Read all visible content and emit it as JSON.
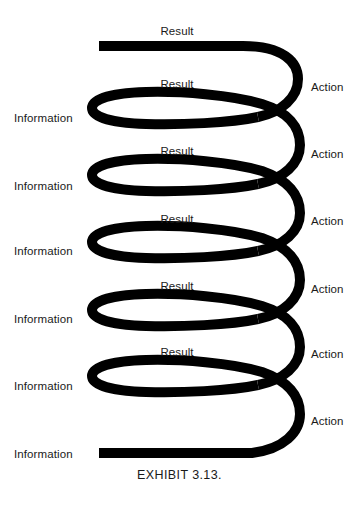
{
  "figure": {
    "caption": "EXHIBIT 3.13.",
    "stroke_color": "#000000",
    "background_color": "#ffffff",
    "text_color": "#1a1a1a",
    "diagram_type": "spiral-feedback-loop",
    "cycles": 6,
    "left_labels": [
      {
        "text": "Information",
        "y": 113
      },
      {
        "text": "Information",
        "y": 181
      },
      {
        "text": "Information",
        "y": 246
      },
      {
        "text": "Information",
        "y": 314
      },
      {
        "text": "Information",
        "y": 381
      },
      {
        "text": "Information",
        "y": 449
      }
    ],
    "right_labels": [
      {
        "text": "Action",
        "y": 82
      },
      {
        "text": "Action",
        "y": 149
      },
      {
        "text": "Action",
        "y": 216
      },
      {
        "text": "Action",
        "y": 284
      },
      {
        "text": "Action",
        "y": 349
      },
      {
        "text": "Action",
        "y": 416
      }
    ],
    "top_labels": [
      {
        "text": "Result",
        "x": 177,
        "y": 26
      },
      {
        "text": "Result",
        "x": 177,
        "y": 79
      },
      {
        "text": "Result",
        "x": 177,
        "y": 146
      },
      {
        "text": "Result",
        "x": 177,
        "y": 214
      },
      {
        "text": "Result",
        "x": 177,
        "y": 281
      },
      {
        "text": "Result",
        "x": 177,
        "y": 347
      }
    ]
  }
}
